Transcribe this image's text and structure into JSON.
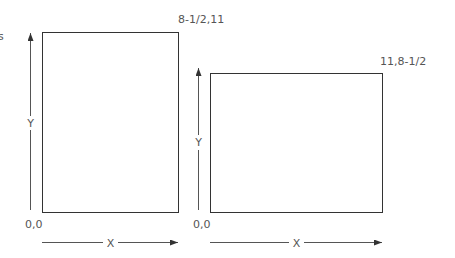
{
  "fragment_text": "s",
  "diagrams": [
    {
      "name": "portrait",
      "corner_origin": "0,0",
      "corner_extent": "8-1/2,11",
      "x_axis_label": "X",
      "y_axis_label": "Y"
    },
    {
      "name": "landscape",
      "corner_origin": "0,0",
      "corner_extent": "11,8-1/2",
      "x_axis_label": "X",
      "y_axis_label": "Y"
    }
  ],
  "colors": {
    "stroke": "#333333",
    "text": "#555555"
  }
}
